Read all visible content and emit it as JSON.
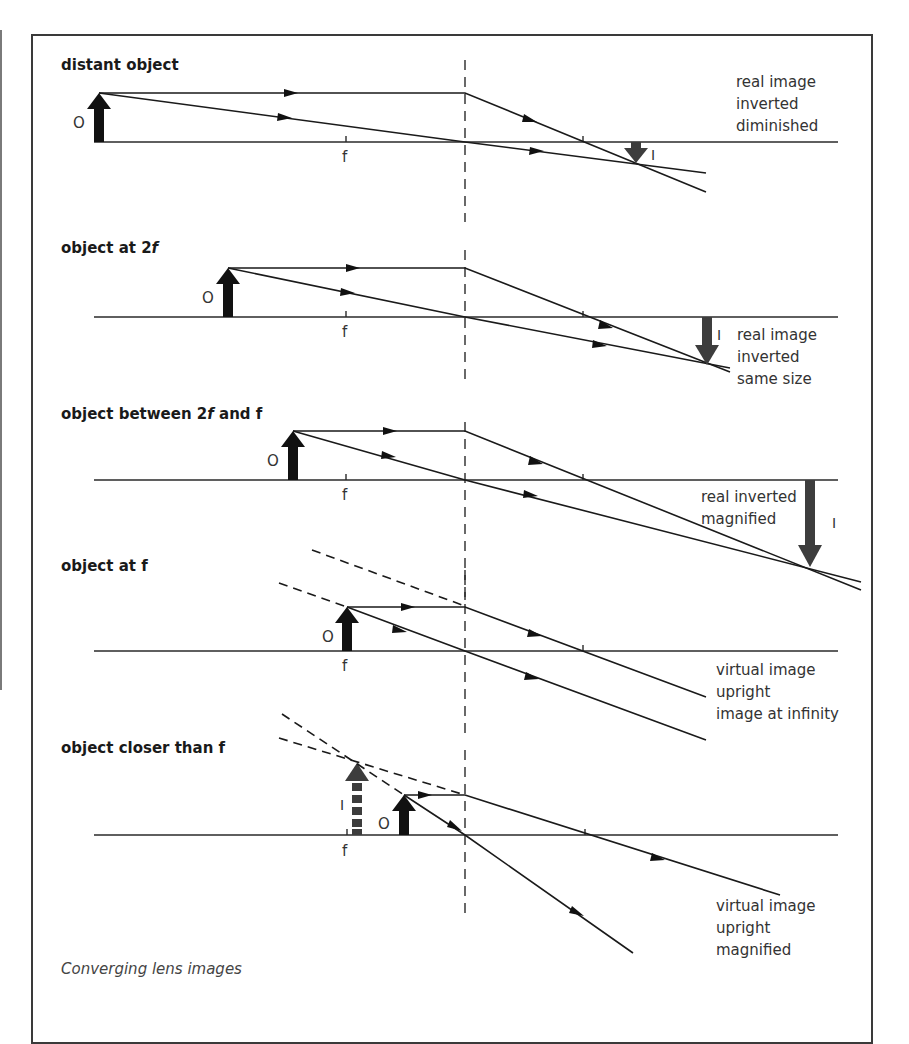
{
  "figure": {
    "caption": "Converging lens images",
    "colors": {
      "background": "#ffffff",
      "frame": "#3a3a3a",
      "rays": "#1a1a1a",
      "object_arrow": "#111111",
      "image_arrow": "#3d3d3d",
      "text": "#333333"
    },
    "labels": {
      "object": "O",
      "image": "I",
      "focal": "f"
    },
    "panels": [
      {
        "title": "distant object",
        "result_lines": [
          "real image",
          "inverted",
          "diminished"
        ]
      },
      {
        "title_prefix": "object at 2",
        "title_italic": "f",
        "title_suffix": "",
        "result_lines": [
          "real image",
          "inverted",
          "same size"
        ]
      },
      {
        "title_prefix": "object between 2",
        "title_italic": "f",
        "title_suffix": " and f",
        "result_lines": [
          "real inverted",
          "magnified"
        ]
      },
      {
        "title": "object at f",
        "result_lines": [
          "virtual image",
          "upright",
          "image at infinity"
        ]
      },
      {
        "title": "object closer than f",
        "result_lines": [
          "virtual image",
          "upright",
          "magnified"
        ]
      }
    ]
  }
}
